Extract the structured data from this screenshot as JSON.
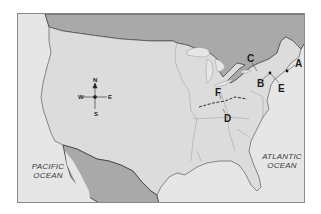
{
  "map": {
    "region": "United States",
    "colors": {
      "water": "#e6e6e6",
      "us_land": "#dcdcdc",
      "foreign_land": "#a9a9a9",
      "border": "#333333",
      "state_lines": "#9a9a9a",
      "frame": "#8a8a8a"
    },
    "compass": {
      "n": "N",
      "s": "S",
      "e": "E",
      "w": "W"
    },
    "oceans": [
      {
        "id": "pacific",
        "line1": "PACIFIC",
        "line2": "OCEAN"
      },
      {
        "id": "atlantic",
        "line1": "ATLANTIC",
        "line2": "OCEAN"
      }
    ],
    "markers": [
      {
        "label": "A"
      },
      {
        "label": "B"
      },
      {
        "label": "C"
      },
      {
        "label": "D"
      },
      {
        "label": "E"
      },
      {
        "label": "F"
      }
    ]
  }
}
